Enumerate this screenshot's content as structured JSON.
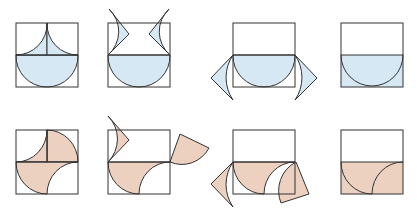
{
  "diagram": {
    "colors": {
      "row1_fill": "#d6e8f4",
      "row2_fill": "#ecd0c0",
      "stroke": "#333333",
      "background": "#ffffff"
    },
    "rows": [
      {
        "name": "blue-row",
        "panels": [
          {
            "step": 1,
            "state": "semicircle-plus-two-cusps"
          },
          {
            "step": 2,
            "state": "cusps-lifted-out"
          },
          {
            "step": 3,
            "state": "cusps-rotated-to-sides"
          },
          {
            "step": 4,
            "state": "bottom-half-rectangle"
          }
        ]
      },
      {
        "name": "peach-row",
        "panels": [
          {
            "step": 1,
            "state": "quarter-circle-pinwheel"
          },
          {
            "step": 2,
            "state": "pieces-lifted-out"
          },
          {
            "step": 3,
            "state": "pieces-rotated-to-sides"
          },
          {
            "step": 4,
            "state": "bottom-half-rectangle"
          }
        ]
      }
    ]
  }
}
